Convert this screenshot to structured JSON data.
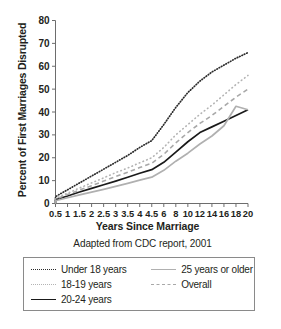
{
  "chart_data": {
    "type": "line",
    "title": "",
    "xlabel": "Years Since Marriage",
    "ylabel": "Percent of First Marriages Disrupted",
    "caption": "Adapted from CDC report, 2001",
    "grid": false,
    "legend_position": "below",
    "ylim": [
      0,
      80
    ],
    "yticks": [
      0,
      10,
      20,
      30,
      40,
      50,
      60,
      70,
      80
    ],
    "x_tick_labels": [
      "0.5",
      "1",
      "1.5",
      "2",
      "2.5",
      "3",
      "3.5",
      "4",
      "4.5",
      "6",
      "8",
      "10",
      "12",
      "14",
      "16",
      "18",
      "20"
    ],
    "x": [
      0.5,
      1,
      1.5,
      2,
      2.5,
      3,
      3.5,
      4,
      4.5,
      6,
      8,
      10,
      12,
      14,
      16,
      18,
      20
    ],
    "series": [
      {
        "name": "Under 18 years",
        "style": "dotted-dense",
        "color": "#2b2b2b",
        "values": [
          3.0,
          6.0,
          9.0,
          12.0,
          15.0,
          18.0,
          21.0,
          24.5,
          27.5,
          34.5,
          42.0,
          48.5,
          53.5,
          57.5,
          60.5,
          63.5,
          66.0
        ]
      },
      {
        "name": "18-19 years",
        "style": "dotted-light",
        "color": "#b3b3b3",
        "values": [
          2.2,
          4.5,
          6.8,
          9.0,
          11.2,
          13.5,
          15.5,
          17.8,
          20.0,
          24.5,
          30.0,
          34.5,
          39.0,
          43.0,
          47.5,
          52.0,
          56.0
        ]
      },
      {
        "name": "20-24 years",
        "style": "solid-black",
        "color": "#1a1a1a",
        "values": [
          1.6,
          3.3,
          5.0,
          6.6,
          8.2,
          9.8,
          11.5,
          13.2,
          14.8,
          18.0,
          22.5,
          27.0,
          31.0,
          33.5,
          36.0,
          38.5,
          41.0
        ]
      },
      {
        "name": "25 years or older",
        "style": "solid-gray",
        "color": "#b0b0b0",
        "values": [
          1.2,
          2.5,
          3.8,
          5.0,
          6.2,
          7.5,
          8.8,
          10.2,
          11.5,
          14.5,
          18.5,
          22.0,
          26.0,
          29.5,
          34.0,
          42.5,
          41.0
        ]
      },
      {
        "name": "Overall",
        "style": "dashed-gray",
        "color": "#a8a8a8",
        "values": [
          1.9,
          3.9,
          5.9,
          7.8,
          9.8,
          11.8,
          13.7,
          15.7,
          17.6,
          21.5,
          26.5,
          31.0,
          35.0,
          38.5,
          42.5,
          46.5,
          50.0
        ]
      }
    ]
  },
  "legend": {
    "items": [
      {
        "label": "Under 18 years"
      },
      {
        "label": "18-19 years"
      },
      {
        "label": "20-24 years"
      },
      {
        "label": "25 years or older"
      },
      {
        "label": "Overall"
      }
    ]
  }
}
